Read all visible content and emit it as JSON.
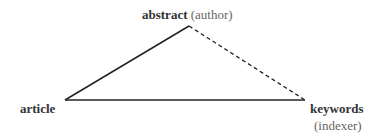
{
  "diagram": {
    "nodes": {
      "abstract": {
        "label": "abstract",
        "note": "(author)"
      },
      "article": {
        "label": "article"
      },
      "keywords": {
        "label": "keywords",
        "note": "(indexer)"
      }
    },
    "edges": [
      {
        "from": "article",
        "to": "abstract",
        "style": "solid"
      },
      {
        "from": "article",
        "to": "keywords",
        "style": "solid"
      },
      {
        "from": "abstract",
        "to": "keywords",
        "style": "dashed"
      }
    ],
    "colors": {
      "line": "#222222",
      "bold_text": "#333333",
      "note_text": "#666666"
    }
  }
}
